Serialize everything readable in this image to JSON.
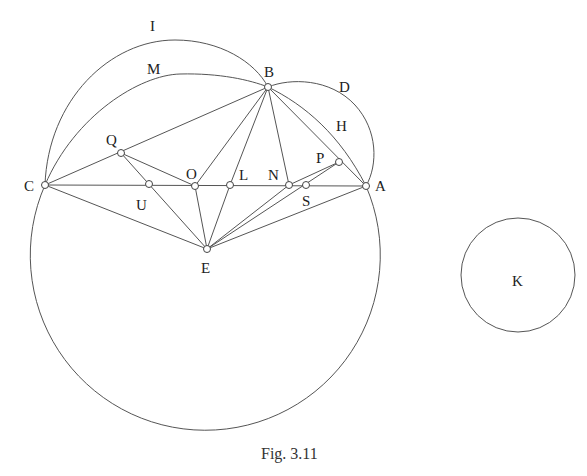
{
  "figure": {
    "caption": "Fig. 3.11",
    "stroke_color": "#555555",
    "background": "#ffffff"
  },
  "points": {
    "A": {
      "label": "A",
      "x": 366,
      "y": 186
    },
    "B": {
      "label": "B",
      "x": 268,
      "y": 87
    },
    "C": {
      "label": "C",
      "x": 45,
      "y": 185
    },
    "E": {
      "label": "E",
      "x": 207,
      "y": 249
    },
    "O": {
      "label": "O",
      "x": 195,
      "y": 186
    },
    "L": {
      "label": "L",
      "x": 230,
      "y": 185
    },
    "N": {
      "label": "N",
      "x": 289,
      "y": 185
    },
    "S": {
      "label": "S",
      "x": 306,
      "y": 185
    },
    "U": {
      "label": "U",
      "x": 149,
      "y": 184
    },
    "Q": {
      "label": "Q",
      "x": 121,
      "y": 153
    },
    "P": {
      "label": "P",
      "x": 339,
      "y": 162
    }
  },
  "arc_labels": {
    "I": "I",
    "M": "M",
    "D": "D",
    "H": "H",
    "K": "K"
  },
  "circles": {
    "main": {
      "center": "E",
      "radius": 175
    },
    "K": {
      "label": "K",
      "cx": 518,
      "cy": 275,
      "r": 57
    }
  },
  "segments": [
    [
      "C",
      "A"
    ],
    [
      "C",
      "B"
    ],
    [
      "C",
      "E"
    ],
    [
      "B",
      "O"
    ],
    [
      "B",
      "L"
    ],
    [
      "B",
      "N"
    ],
    [
      "B",
      "A"
    ],
    [
      "Q",
      "O"
    ],
    [
      "Q",
      "E"
    ],
    [
      "E",
      "O"
    ],
    [
      "E",
      "L"
    ],
    [
      "E",
      "N"
    ],
    [
      "E",
      "P"
    ],
    [
      "E",
      "A"
    ],
    [
      "N",
      "P"
    ]
  ]
}
